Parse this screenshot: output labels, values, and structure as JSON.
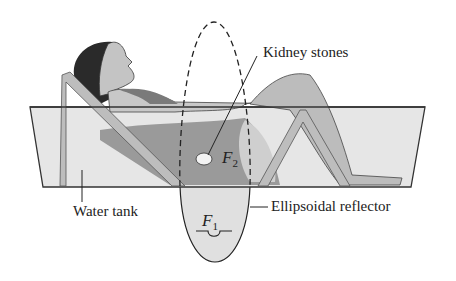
{
  "figure": {
    "labels": {
      "kidney_stones": "Kidney stones",
      "water_tank": "Water tank",
      "ellipsoidal_reflector": "Ellipsoidal reflector",
      "focus_1_letter": "F",
      "focus_1_sub": "1",
      "focus_2_letter": "F",
      "focus_2_sub": "2"
    },
    "colors": {
      "tank_fill": "#e6e6e6",
      "tank_stroke": "#333333",
      "water_dark": "#8c8c8c",
      "chair": "#bdbdbd",
      "skin": "#c4c4c4",
      "hair": "#2a2a2a",
      "swimsuit": "#7a7a7a",
      "reflector_fill": "#e0e0e0"
    }
  }
}
